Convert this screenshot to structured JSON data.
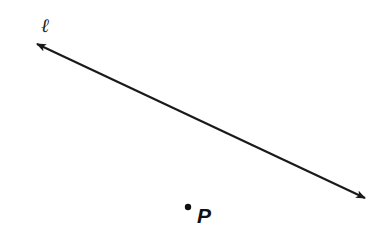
{
  "diagram": {
    "line": {
      "label": "ℓ",
      "arrows": "both-ends",
      "color": "#1a1a1a"
    },
    "point": {
      "label": "P",
      "color": "#111111"
    }
  }
}
